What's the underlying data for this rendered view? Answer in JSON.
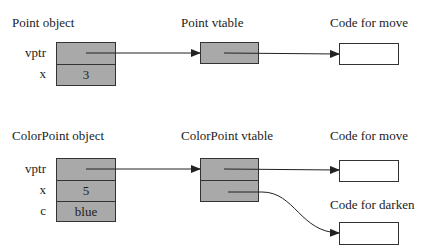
{
  "diagram": {
    "point": {
      "object_title": "Point object",
      "vtable_title": "Point vtable",
      "code_title": "Code for move",
      "fields": [
        {
          "name": "vptr",
          "value": ""
        },
        {
          "name": "x",
          "value": "3"
        }
      ]
    },
    "colorpoint": {
      "object_title": "ColorPoint object",
      "vtable_title": "ColorPoint vtable",
      "code_move_title": "Code for move",
      "code_darken_title": "Code for darken",
      "fields": [
        {
          "name": "vptr",
          "value": ""
        },
        {
          "name": "x",
          "value": "5"
        },
        {
          "name": "c",
          "value": "blue"
        }
      ]
    },
    "colors": {
      "cell_fill": "#a9a9a9",
      "code_fill": "#ffffff",
      "stroke": "#333333"
    }
  }
}
